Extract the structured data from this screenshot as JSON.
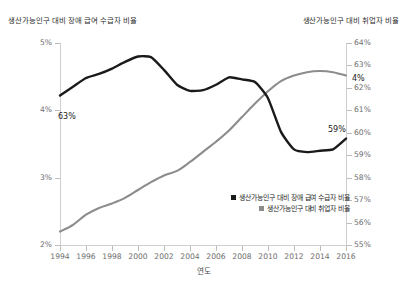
{
  "titles": {
    "left_axis_title": "생산가능인구 대비 장애 급여 수급자 비율",
    "right_axis_title": "생산가능인구 대비 취업자 비율"
  },
  "axes": {
    "x_title": "연도",
    "left_ticks": [
      "5%",
      "4%",
      "3%",
      "2%"
    ],
    "right_ticks": [
      "64%",
      "63%",
      "62%",
      "61%",
      "60%",
      "59%",
      "58%",
      "57%",
      "56%",
      "55%"
    ],
    "x_ticks": [
      "1994",
      "1996",
      "1998",
      "2000",
      "2002",
      "2004",
      "2006",
      "2008",
      "2010",
      "2012",
      "2014",
      "2016"
    ]
  },
  "legend": {
    "items": [
      {
        "label": "생산가능인구 대비 장애 급여 수급자 비율",
        "color": "#1a1a1a"
      },
      {
        "label": "생산가능인구 대비 취업자 비율",
        "color": "#8c8c8c"
      }
    ]
  },
  "annotations": {
    "disability_start": "63%",
    "disability_end": "59%",
    "employment_end": "4%"
  },
  "colors": {
    "disability_line": "#1a1a1a",
    "employment_line": "#8c8c8c",
    "axis": "#cfcfcf",
    "tick_text": "#6e6e6e",
    "background": "#ffffff"
  },
  "chart_data": {
    "type": "line",
    "title": "",
    "xlabel": "연도",
    "ylabel": "생산가능인구 대비 장애 급여 수급자 비율",
    "y2label": "생산가능인구 대비 취업자 비율",
    "grid": false,
    "legend_position": "bottom-right",
    "x": [
      1994,
      1995,
      1996,
      1997,
      1998,
      1999,
      2000,
      2001,
      2002,
      2003,
      2004,
      2005,
      2006,
      2007,
      2008,
      2009,
      2010,
      2011,
      2012,
      2013,
      2014,
      2015,
      2016
    ],
    "xlim": [
      1994,
      2016
    ],
    "ylim": [
      2,
      5
    ],
    "y2lim": [
      55,
      64
    ],
    "series": [
      {
        "name": "생산가능인구 대비 장애 급여 수급자 비율",
        "axis": "left",
        "color": "#1a1a1a",
        "unit": "%",
        "values": [
          4.22,
          4.35,
          4.48,
          4.54,
          4.62,
          4.72,
          4.8,
          4.79,
          4.6,
          4.38,
          4.29,
          4.3,
          4.38,
          4.49,
          4.46,
          4.42,
          4.18,
          3.68,
          3.42,
          3.38,
          3.4,
          3.42,
          3.58
        ]
      },
      {
        "name": "생산가능인구 대비 취업자 비율",
        "axis": "right",
        "color": "#8c8c8c",
        "unit": "%",
        "values": [
          55.6,
          55.9,
          56.35,
          56.65,
          56.85,
          57.1,
          57.45,
          57.8,
          58.1,
          58.3,
          58.7,
          59.15,
          59.6,
          60.1,
          60.7,
          61.3,
          61.85,
          62.3,
          62.55,
          62.7,
          62.75,
          62.7,
          62.55
        ]
      }
    ],
    "point_labels": [
      {
        "series": "생산가능인구 대비 장애 급여 수급자 비율",
        "x": 1994,
        "text": "63%"
      },
      {
        "series": "생산가능인구 대비 장애 급여 수급자 비율",
        "x": 2016,
        "text": "59%"
      },
      {
        "series": "생산가능인구 대비 취업자 비율",
        "x": 2016,
        "text": "4%"
      }
    ]
  }
}
